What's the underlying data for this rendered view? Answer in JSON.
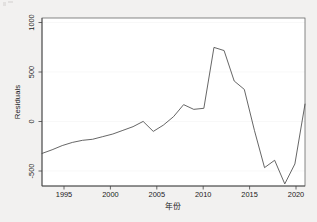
{
  "chart_data": {
    "type": "line",
    "title": "",
    "xlabel": "年份",
    "ylabel": "Residuals",
    "xlim": [
      1994,
      2020
    ],
    "ylim": [
      -600,
      1000
    ],
    "grid": true,
    "legend": "none",
    "x_ticks": [
      "1995",
      "2000",
      "2005",
      "2010",
      "2015",
      "2020"
    ],
    "x_tick_values": [
      1995,
      2000,
      2005,
      2010,
      2015,
      2020
    ],
    "y_ticks": [
      "1000",
      "500",
      "0",
      "-500"
    ],
    "y_tick_values": [
      1000,
      500,
      0,
      -500
    ],
    "series": [
      {
        "name": "Residuals",
        "color": "#4a4a4a",
        "x": [
          1994,
          1995,
          1996,
          1997,
          1998,
          1999,
          2000,
          2001,
          2002,
          2003,
          2004,
          2005,
          2006,
          2007,
          2008,
          2009,
          2010,
          2011,
          2012,
          2013,
          2014,
          2015,
          2016,
          2017,
          2018,
          2019,
          2020
        ],
        "values": [
          -290,
          -255,
          -215,
          -185,
          -165,
          -155,
          -130,
          -105,
          -70,
          -35,
          15,
          -80,
          -20,
          60,
          175,
          130,
          140,
          720,
          690,
          400,
          320,
          -70,
          -425,
          -355,
          -580,
          -390,
          180
        ]
      }
    ]
  },
  "figure": {
    "background_color": "#f2f1f0",
    "plot_background_color": "#ffffff",
    "frame_color": "#555555",
    "line_color": "#4a4a4a"
  }
}
